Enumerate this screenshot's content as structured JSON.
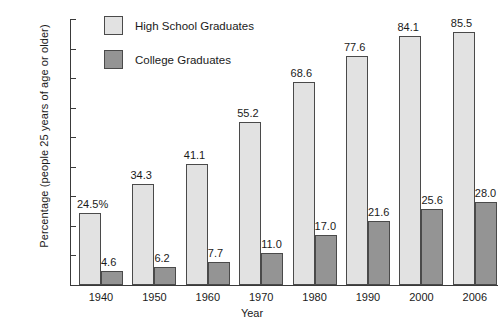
{
  "chart_data": {
    "type": "bar",
    "title": "",
    "xlabel": "Year",
    "ylabel": "Percentage (people 25 years of age or older)",
    "categories": [
      "1940",
      "1950",
      "1960",
      "1970",
      "1980",
      "1990",
      "2000",
      "2006"
    ],
    "series": [
      {
        "name": "High School Graduates",
        "color": "#e2e2e2",
        "values": [
          24.5,
          34.3,
          41.1,
          55.2,
          68.6,
          77.6,
          84.1,
          85.5
        ],
        "labels": [
          "24.5%",
          "34.3",
          "41.1",
          "55.2",
          "68.6",
          "77.6",
          "84.1",
          "85.5"
        ]
      },
      {
        "name": "College Graduates",
        "color": "#949494",
        "values": [
          4.6,
          6.2,
          7.7,
          11.0,
          17.0,
          21.6,
          25.6,
          28.0
        ],
        "labels": [
          "4.6",
          "6.2",
          "7.7",
          "11.0",
          "17.0",
          "21.6",
          "25.6",
          "28.0"
        ]
      }
    ],
    "ylim": [
      0,
      90
    ],
    "yticks": [
      0,
      10,
      20,
      30,
      40,
      50,
      60,
      70,
      80,
      90
    ],
    "ytick_labels": [
      "0",
      "10",
      "20",
      "30",
      "40",
      "50",
      "60",
      "70",
      "80",
      "90%"
    ],
    "grid": false,
    "legend_position": "top-left-inside"
  },
  "legend": {
    "items": [
      {
        "label": "High School Graduates",
        "color": "#e2e2e2"
      },
      {
        "label": "College Graduates",
        "color": "#949494"
      }
    ]
  }
}
